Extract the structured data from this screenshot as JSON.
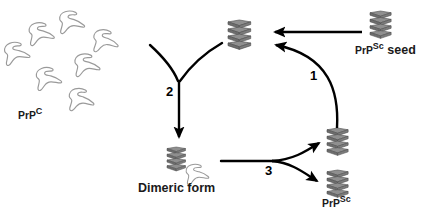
{
  "figure": {
    "background_color": "#ffffff",
    "width": 423,
    "height": 215
  },
  "colors": {
    "prpc_outline": "#9a9a9a",
    "prpc_fill": "#ffffff",
    "sheet_fill": "#8c8c8c",
    "sheet_fill_light": "#a8a8a8",
    "sheet_stroke": "#4a4a4a",
    "arrow": "#000000",
    "text": "#1a1a1a"
  },
  "labels": {
    "prpc": {
      "base": "PrP",
      "sup": "C",
      "full": "PrPC"
    },
    "prpsc_seed": {
      "base": "PrP",
      "sup": "Sc",
      "suffix": " seed",
      "full": "PrPSc seed"
    },
    "dimeric_form": {
      "text": "Dimeric form"
    },
    "prpsc": {
      "base": "PrP",
      "sup": "Sc",
      "full": "PrPSc"
    }
  },
  "step_numbers": {
    "one": "1",
    "two": "2",
    "three": "3"
  },
  "species": [
    {
      "id": "prpc-pool",
      "name": "PrP C monomer pool",
      "icon": "prpc-monomer-icon",
      "count": 9,
      "label": "PrPC",
      "region": "upper-left"
    },
    {
      "id": "prpsc-center",
      "name": "PrP Sc beta-sheet aggregate",
      "icon": "beta-sheet-stack-icon",
      "count": 1,
      "label": "",
      "region": "upper-center"
    },
    {
      "id": "prpsc-seed",
      "name": "PrP Sc seed",
      "icon": "beta-sheet-stack-icon",
      "count": 1,
      "label": "PrPSc seed",
      "region": "upper-right"
    },
    {
      "id": "dimeric-form",
      "name": "Dimeric form complex",
      "icon": "dimer-complex-icon",
      "count": 1,
      "label": "Dimeric form",
      "region": "lower-center"
    },
    {
      "id": "prpsc-product-top",
      "name": "PrP Sc product upper",
      "icon": "beta-sheet-stack-icon",
      "count": 1,
      "label": "",
      "region": "lower-right-upper"
    },
    {
      "id": "prpsc-product-bottom",
      "name": "PrP Sc product lower",
      "icon": "beta-sheet-stack-icon",
      "count": 1,
      "label": "PrPSc",
      "region": "lower-right-lower"
    }
  ],
  "arrows": [
    {
      "id": "seed-to-center",
      "name": "seed-to-aggregate-arrow",
      "style": "straight",
      "from": "prpsc-seed",
      "to": "prpsc-center",
      "number": ""
    },
    {
      "id": "step-1",
      "name": "recycle-arrow-step-1",
      "style": "curved",
      "from": "prpsc-product-top",
      "to": "prpsc-center",
      "number": "1"
    },
    {
      "id": "step-2",
      "name": "merge-arrow-step-2",
      "style": "y-merge-down",
      "from": "prpc-pool + prpsc-center",
      "to": "dimeric-form",
      "number": "2"
    },
    {
      "id": "step-3",
      "name": "split-arrow-step-3",
      "style": "split-fork",
      "from": "dimeric-form",
      "to": "prpsc-product-top + prpsc-product-bottom",
      "number": "3"
    }
  ]
}
